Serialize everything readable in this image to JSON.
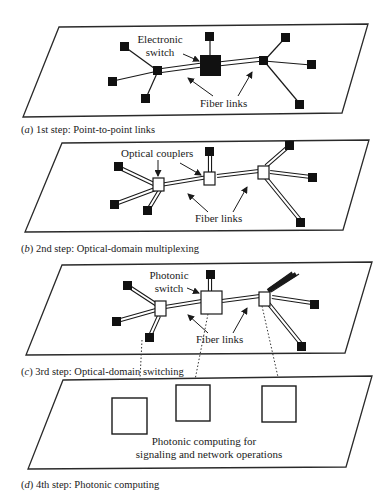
{
  "panels": [
    {
      "id": "a",
      "caption_letter": "a",
      "caption": "1st step: Point-to-point links",
      "labels": {
        "switch": [
          "Electronic",
          "switch"
        ],
        "fiber": "Fiber links"
      }
    },
    {
      "id": "b",
      "caption_letter": "b",
      "caption": "2nd step: Optical-domain multiplexing",
      "labels": {
        "couplers": "Optical couplers",
        "fiber": "Fiber links"
      }
    },
    {
      "id": "c",
      "caption_letter": "c",
      "caption": "3rd step: Optical-domain switching",
      "labels": {
        "switch": [
          "Photonic",
          "switch"
        ],
        "fiber": "Fiber links"
      }
    },
    {
      "id": "d",
      "caption_letter": "d",
      "caption": "4th step: Photonic computing",
      "labels": {
        "computing": [
          "Photonic computing for",
          "signaling and network operations"
        ]
      }
    }
  ],
  "colors": {
    "line": "#1a1a1a",
    "background": "#ffffff",
    "node": "#111111"
  }
}
